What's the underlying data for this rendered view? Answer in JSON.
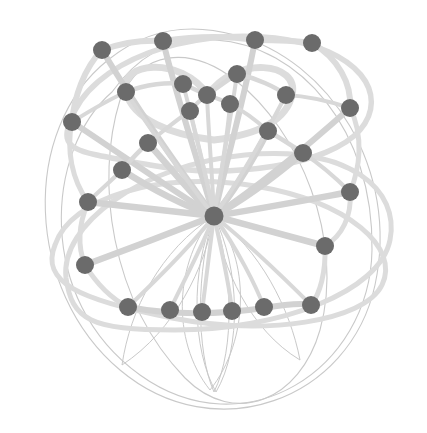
{
  "figure": {
    "kind": "node-link-graph-diagram",
    "title": "",
    "background_color": "#ffffff",
    "width": 427,
    "height": 433
  },
  "style": {
    "node_color": "#6b6b6b",
    "node_radius": 9,
    "hub_radius": 9.5,
    "edge_color_light": "#dcdcdc",
    "edge_color_mid": "#d2d2d2",
    "edge_color_hairline": "#c9c9c9",
    "edge_width_thin": 1.0,
    "edge_width_medium": 4.0,
    "edge_width_thick": 6.5
  },
  "chart_data": {
    "type": "scatter",
    "title": "",
    "xlabel": "",
    "ylabel": "",
    "grid": false,
    "legend": "none",
    "xlim": [
      0,
      427
    ],
    "ylim": [
      0,
      433
    ],
    "node_count": 33,
    "nodes": [
      {
        "id": "hub",
        "x": 214,
        "y": 216,
        "degree": 14,
        "role": "hub"
      },
      {
        "id": "n01",
        "x": 102,
        "y": 50,
        "degree": 3,
        "role": "outer-ring"
      },
      {
        "id": "n02",
        "x": 163,
        "y": 41,
        "degree": 3,
        "role": "outer-ring"
      },
      {
        "id": "n03",
        "x": 255,
        "y": 40,
        "degree": 3,
        "role": "outer-ring"
      },
      {
        "id": "n04",
        "x": 312,
        "y": 43,
        "degree": 3,
        "role": "outer-ring"
      },
      {
        "id": "n05",
        "x": 72,
        "y": 122,
        "degree": 3,
        "role": "outer-ring"
      },
      {
        "id": "n06",
        "x": 350,
        "y": 108,
        "degree": 3,
        "role": "outer-ring"
      },
      {
        "id": "n07",
        "x": 126,
        "y": 92,
        "degree": 3,
        "role": "mid-ring"
      },
      {
        "id": "n08",
        "x": 183,
        "y": 84,
        "degree": 4,
        "role": "inner-cluster"
      },
      {
        "id": "n09",
        "x": 207,
        "y": 95,
        "degree": 4,
        "role": "inner-cluster"
      },
      {
        "id": "n10",
        "x": 237,
        "y": 74,
        "degree": 3,
        "role": "inner-cluster"
      },
      {
        "id": "n11",
        "x": 190,
        "y": 111,
        "degree": 3,
        "role": "inner-cluster"
      },
      {
        "id": "n12",
        "x": 230,
        "y": 104,
        "degree": 3,
        "role": "inner-cluster"
      },
      {
        "id": "n13",
        "x": 286,
        "y": 95,
        "degree": 3,
        "role": "mid-ring"
      },
      {
        "id": "n14",
        "x": 148,
        "y": 143,
        "degree": 3,
        "role": "spoke"
      },
      {
        "id": "n15",
        "x": 268,
        "y": 131,
        "degree": 3,
        "role": "spoke"
      },
      {
        "id": "n16",
        "x": 122,
        "y": 170,
        "degree": 4,
        "role": "spoke"
      },
      {
        "id": "n17",
        "x": 303,
        "y": 153,
        "degree": 3,
        "role": "spoke"
      },
      {
        "id": "n18",
        "x": 88,
        "y": 202,
        "degree": 3,
        "role": "outer-ring"
      },
      {
        "id": "n19",
        "x": 350,
        "y": 192,
        "degree": 3,
        "role": "outer-ring"
      },
      {
        "id": "n20",
        "x": 325,
        "y": 246,
        "degree": 3,
        "role": "outer-ring"
      },
      {
        "id": "n21",
        "x": 85,
        "y": 265,
        "degree": 3,
        "role": "outer-ring"
      },
      {
        "id": "n22",
        "x": 128,
        "y": 307,
        "degree": 3,
        "role": "bottom-row"
      },
      {
        "id": "n23",
        "x": 170,
        "y": 310,
        "degree": 3,
        "role": "bottom-row"
      },
      {
        "id": "n24",
        "x": 202,
        "y": 312,
        "degree": 3,
        "role": "bottom-row"
      },
      {
        "id": "n25",
        "x": 232,
        "y": 311,
        "degree": 3,
        "role": "bottom-row"
      },
      {
        "id": "n26",
        "x": 264,
        "y": 307,
        "degree": 4,
        "role": "bottom-row"
      },
      {
        "id": "n27",
        "x": 311,
        "y": 305,
        "degree": 3,
        "role": "bottom-row"
      },
      {
        "id": "n28",
        "x": 345,
        "y": 108,
        "degree": 2,
        "role": "outer-ring"
      },
      {
        "id": "n29",
        "x": 166,
        "y": 110,
        "degree": 2,
        "role": "inner-cluster"
      },
      {
        "id": "n30",
        "x": 212,
        "y": 120,
        "degree": 2,
        "role": "inner-cluster"
      },
      {
        "id": "n31",
        "x": 118,
        "y": 215,
        "degree": 2,
        "role": "spoke"
      },
      {
        "id": "n32",
        "x": 150,
        "y": 248,
        "degree": 2,
        "role": "spoke"
      }
    ],
    "edge_count": 48
  }
}
